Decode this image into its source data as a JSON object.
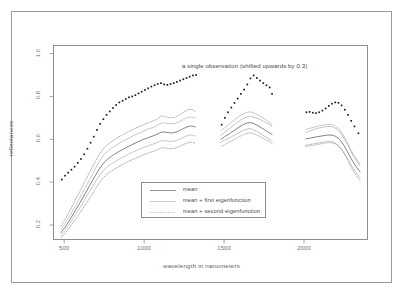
{
  "figure": {
    "outer_border_color": "#9a9a9a",
    "background": "#ffffff"
  },
  "annotation": {
    "text": "a single observation (shifted upwards by 0.3)"
  },
  "legend": {
    "items": [
      {
        "label": "mean",
        "style": "solid",
        "color": "#5a5a5a"
      },
      {
        "label": "mean + first eigenfunction",
        "style": "solid",
        "color": "#b4b4b4"
      },
      {
        "label": "mean + second eigenfunction",
        "style": "dotted",
        "color": "#8e8e8e"
      }
    ]
  },
  "chart_data": {
    "type": "line",
    "title": "",
    "xlabel": "wavelength in nanometers",
    "ylabel": "reflectances",
    "xlim": [
      430,
      2400
    ],
    "ylim": [
      0.13,
      1.04
    ],
    "xticks": [
      500,
      1000,
      1500,
      2000
    ],
    "xtick_labels": [
      "500",
      "1000",
      "1500",
      "2000"
    ],
    "yticks": [
      0.2,
      0.4,
      0.6,
      0.8,
      1.0
    ],
    "ytick_labels": [
      "0.2",
      "0.4",
      "0.6",
      "0.8",
      "1.0"
    ],
    "grid": false,
    "legend_position": "inside-lower-center",
    "segments": [
      {
        "name": "segment-1",
        "x_range": [
          480,
          1330
        ]
      },
      {
        "name": "segment-2",
        "x_range": [
          1480,
          1800
        ]
      },
      {
        "name": "segment-3",
        "x_range": [
          2010,
          2350
        ]
      }
    ],
    "series": [
      {
        "name": "mean",
        "style": "solid",
        "color": "#5a5a5a",
        "segments": [
          {
            "x": [
              480,
              510,
              540,
              570,
              600,
              630,
              660,
              690,
              720,
              750,
              780,
              810,
              840,
              870,
              900,
              930,
              960,
              990,
              1020,
              1050,
              1080,
              1110,
              1140,
              1170,
              1200,
              1230,
              1260,
              1290,
              1320
            ],
            "y": [
              0.165,
              0.195,
              0.23,
              0.268,
              0.305,
              0.345,
              0.385,
              0.425,
              0.462,
              0.492,
              0.512,
              0.528,
              0.542,
              0.554,
              0.566,
              0.577,
              0.588,
              0.598,
              0.606,
              0.614,
              0.623,
              0.634,
              0.632,
              0.63,
              0.634,
              0.644,
              0.655,
              0.662,
              0.658
            ]
          },
          {
            "x": [
              1480,
              1510,
              1540,
              1570,
              1600,
              1630,
              1660,
              1690,
              1720,
              1750,
              1780,
              1800
            ],
            "y": [
              0.6,
              0.615,
              0.63,
              0.645,
              0.66,
              0.672,
              0.678,
              0.672,
              0.66,
              0.646,
              0.632,
              0.622
            ]
          },
          {
            "x": [
              2010,
              2040,
              2070,
              2100,
              2130,
              2160,
              2190,
              2220,
              2250,
              2280,
              2310,
              2350
            ],
            "y": [
              0.602,
              0.606,
              0.61,
              0.614,
              0.618,
              0.62,
              0.616,
              0.6,
              0.57,
              0.53,
              0.49,
              0.448
            ]
          }
        ]
      },
      {
        "name": "mean + first eigenfunction (upper)",
        "style": "solid",
        "color": "#b4b4b4",
        "segments": [
          {
            "x": [
              480,
              510,
              540,
              570,
              600,
              630,
              660,
              690,
              720,
              750,
              780,
              810,
              840,
              870,
              900,
              930,
              960,
              990,
              1020,
              1050,
              1080,
              1110,
              1140,
              1170,
              1200,
              1230,
              1260,
              1290,
              1320
            ],
            "y": [
              0.18,
              0.212,
              0.25,
              0.29,
              0.33,
              0.372,
              0.414,
              0.456,
              0.496,
              0.528,
              0.55,
              0.566,
              0.58,
              0.592,
              0.604,
              0.616,
              0.626,
              0.636,
              0.646,
              0.654,
              0.664,
              0.676,
              0.674,
              0.672,
              0.676,
              0.686,
              0.698,
              0.704,
              0.7
            ]
          },
          {
            "x": [
              1480,
              1510,
              1540,
              1570,
              1600,
              1630,
              1660,
              1690,
              1720,
              1750,
              1780,
              1800
            ],
            "y": [
              0.64,
              0.658,
              0.676,
              0.694,
              0.71,
              0.722,
              0.728,
              0.722,
              0.71,
              0.696,
              0.68,
              0.668
            ]
          },
          {
            "x": [
              2010,
              2040,
              2070,
              2100,
              2130,
              2160,
              2190,
              2220,
              2250,
              2280,
              2310,
              2350
            ],
            "y": [
              0.646,
              0.652,
              0.658,
              0.664,
              0.668,
              0.67,
              0.664,
              0.646,
              0.614,
              0.572,
              0.528,
              0.484
            ]
          }
        ]
      },
      {
        "name": "mean + first eigenfunction (lower)",
        "style": "solid",
        "color": "#b4b4b4",
        "segments": [
          {
            "x": [
              480,
              510,
              540,
              570,
              600,
              630,
              660,
              690,
              720,
              750,
              780,
              810,
              840,
              870,
              900,
              930,
              960,
              990,
              1020,
              1050,
              1080,
              1110,
              1140,
              1170,
              1200,
              1230,
              1260,
              1290,
              1320
            ],
            "y": [
              0.152,
              0.18,
              0.212,
              0.248,
              0.282,
              0.32,
              0.358,
              0.396,
              0.43,
              0.458,
              0.478,
              0.492,
              0.506,
              0.518,
              0.53,
              0.54,
              0.55,
              0.56,
              0.568,
              0.576,
              0.584,
              0.594,
              0.592,
              0.59,
              0.594,
              0.604,
              0.614,
              0.62,
              0.616
            ]
          },
          {
            "x": [
              1480,
              1510,
              1540,
              1570,
              1600,
              1630,
              1660,
              1690,
              1720,
              1750,
              1780,
              1800
            ],
            "y": [
              0.566,
              0.578,
              0.59,
              0.602,
              0.614,
              0.624,
              0.63,
              0.624,
              0.614,
              0.602,
              0.59,
              0.58
            ]
          },
          {
            "x": [
              2010,
              2040,
              2070,
              2100,
              2130,
              2160,
              2190,
              2220,
              2250,
              2280,
              2310,
              2350
            ],
            "y": [
              0.566,
              0.57,
              0.574,
              0.578,
              0.582,
              0.584,
              0.58,
              0.566,
              0.538,
              0.5,
              0.462,
              0.422
            ]
          }
        ]
      },
      {
        "name": "mean + second eigenfunction (upper)",
        "style": "dotted",
        "color": "#8e8e8e",
        "segments": [
          {
            "x": [
              480,
              510,
              540,
              570,
              600,
              630,
              660,
              690,
              720,
              750,
              780,
              810,
              840,
              870,
              900,
              930,
              960,
              990,
              1020,
              1050,
              1080,
              1110,
              1140,
              1170,
              1200,
              1230,
              1260,
              1290,
              1320
            ],
            "y": [
              0.196,
              0.232,
              0.274,
              0.318,
              0.36,
              0.404,
              0.448,
              0.49,
              0.53,
              0.56,
              0.58,
              0.596,
              0.61,
              0.622,
              0.634,
              0.646,
              0.656,
              0.666,
              0.676,
              0.684,
              0.694,
              0.708,
              0.704,
              0.7,
              0.706,
              0.718,
              0.732,
              0.74,
              0.73
            ]
          },
          {
            "x": [
              1480,
              1510,
              1540,
              1570,
              1600,
              1630,
              1660,
              1690,
              1720,
              1750,
              1780,
              1800
            ],
            "y": [
              0.618,
              0.636,
              0.654,
              0.672,
              0.688,
              0.7,
              0.706,
              0.702,
              0.694,
              0.682,
              0.67,
              0.66
            ]
          },
          {
            "x": [
              2010,
              2040,
              2070,
              2100,
              2130,
              2160,
              2190,
              2220,
              2250,
              2280,
              2310,
              2350
            ],
            "y": [
              0.632,
              0.64,
              0.648,
              0.654,
              0.658,
              0.66,
              0.654,
              0.636,
              0.604,
              0.562,
              0.52,
              0.476
            ]
          }
        ]
      },
      {
        "name": "mean + second eigenfunction (lower)",
        "style": "dotted",
        "color": "#8e8e8e",
        "segments": [
          {
            "x": [
              480,
              510,
              540,
              570,
              600,
              630,
              660,
              690,
              720,
              750,
              780,
              810,
              840,
              870,
              900,
              930,
              960,
              990,
              1020,
              1050,
              1080,
              1110,
              1140,
              1170,
              1200,
              1230,
              1260,
              1290,
              1320
            ],
            "y": [
              0.14,
              0.166,
              0.194,
              0.226,
              0.258,
              0.292,
              0.326,
              0.362,
              0.396,
              0.424,
              0.444,
              0.458,
              0.472,
              0.484,
              0.496,
              0.506,
              0.516,
              0.526,
              0.534,
              0.542,
              0.55,
              0.56,
              0.558,
              0.556,
              0.56,
              0.57,
              0.58,
              0.586,
              0.582
            ]
          },
          {
            "x": [
              1480,
              1510,
              1540,
              1570,
              1600,
              1630,
              1660,
              1690,
              1720,
              1750,
              1780,
              1800
            ],
            "y": [
              0.586,
              0.598,
              0.61,
              0.622,
              0.634,
              0.644,
              0.65,
              0.642,
              0.63,
              0.616,
              0.602,
              0.592
            ]
          },
          {
            "x": [
              2010,
              2040,
              2070,
              2100,
              2130,
              2160,
              2190,
              2220,
              2250,
              2280,
              2310,
              2350
            ],
            "y": [
              0.572,
              0.576,
              0.58,
              0.584,
              0.588,
              0.59,
              0.584,
              0.566,
              0.534,
              0.492,
              0.45,
              0.408
            ]
          }
        ]
      },
      {
        "name": "a single observation (shifted upwards by 0.3)",
        "style": "dotted-markers",
        "color": "#1f1f1f",
        "segments": [
          {
            "x": [
              485,
              505,
              525,
              545,
              565,
              585,
              605,
              625,
              645,
              665,
              685,
              705,
              725,
              745,
              765,
              785,
              805,
              825,
              845,
              865,
              885,
              905,
              925,
              945,
              965,
              985,
              1005,
              1025,
              1045,
              1065,
              1085,
              1105,
              1125,
              1145,
              1165,
              1185,
              1205,
              1225,
              1245,
              1265,
              1285,
              1305,
              1325
            ],
            "y": [
              0.412,
              0.43,
              0.444,
              0.458,
              0.472,
              0.49,
              0.508,
              0.53,
              0.556,
              0.584,
              0.612,
              0.644,
              0.672,
              0.694,
              0.714,
              0.73,
              0.746,
              0.76,
              0.772,
              0.78,
              0.788,
              0.796,
              0.8,
              0.806,
              0.814,
              0.822,
              0.83,
              0.838,
              0.846,
              0.852,
              0.858,
              0.862,
              0.856,
              0.854,
              0.858,
              0.862,
              0.868,
              0.874,
              0.88,
              0.886,
              0.892,
              0.898,
              0.9
            ]
          },
          {
            "x": [
              1485,
              1505,
              1525,
              1545,
              1565,
              1585,
              1605,
              1625,
              1645,
              1665,
              1685,
              1705,
              1725,
              1745,
              1765,
              1785,
              1800
            ],
            "y": [
              0.668,
              0.7,
              0.726,
              0.748,
              0.77,
              0.79,
              0.812,
              0.832,
              0.856,
              0.884,
              0.898,
              0.886,
              0.874,
              0.862,
              0.852,
              0.842,
              0.812
            ]
          },
          {
            "x": [
              2015,
              2035,
              2055,
              2075,
              2095,
              2115,
              2135,
              2155,
              2175,
              2195,
              2215,
              2235,
              2255,
              2275,
              2295,
              2315,
              2340
            ],
            "y": [
              0.726,
              0.728,
              0.724,
              0.722,
              0.726,
              0.734,
              0.744,
              0.756,
              0.766,
              0.772,
              0.77,
              0.758,
              0.738,
              0.714,
              0.686,
              0.66,
              0.628
            ]
          }
        ]
      }
    ]
  }
}
